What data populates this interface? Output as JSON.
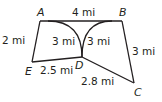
{
  "diagram": {
    "vertices": [
      {
        "id": "A",
        "label": "A",
        "x": 40,
        "y": 21
      },
      {
        "id": "B",
        "label": "B",
        "x": 122,
        "y": 21
      },
      {
        "id": "C",
        "label": "C",
        "x": 134,
        "y": 83
      },
      {
        "id": "D",
        "label": "D",
        "x": 82,
        "y": 57
      },
      {
        "id": "E",
        "label": "E",
        "x": 32,
        "y": 62
      }
    ],
    "edges": [
      {
        "from": "A",
        "to": "B",
        "type": "line",
        "length": "4 mi"
      },
      {
        "from": "B",
        "to": "C",
        "type": "line",
        "length": "3 mi"
      },
      {
        "from": "C",
        "to": "D",
        "type": "line",
        "length": "2.8 mi"
      },
      {
        "from": "D",
        "to": "E",
        "type": "line",
        "length": "2.5 mi"
      },
      {
        "from": "E",
        "to": "A",
        "type": "line",
        "length": "2 mi"
      },
      {
        "from": "A",
        "to": "D",
        "type": "arc",
        "length": "3 mi"
      },
      {
        "from": "B",
        "to": "D",
        "type": "arc",
        "length": "3 mi"
      }
    ],
    "labels": {
      "A": "A",
      "B": "B",
      "C": "C",
      "D": "D",
      "E": "E",
      "AB": "4 mi",
      "EA": "2 mi",
      "AD_arc": "3 mi",
      "BD_arc": "3 mi",
      "BC": "3 mi",
      "ED": "2.5 mi",
      "DC": "2.8 mi"
    },
    "stroke_color": "#231f20"
  }
}
